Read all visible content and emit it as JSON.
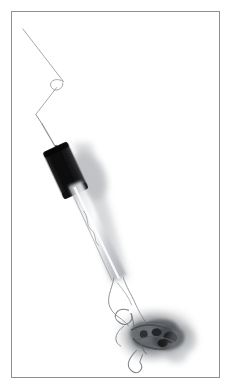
{
  "image": {
    "subject_label": "Tangled wire with black ferrule and knotted thread mass",
    "background_color": "#ffffff",
    "frame_color": "#8d8f93",
    "frame_inset_px": 11,
    "frame_border_px": 1,
    "orientation": "portrait",
    "width_px": 233,
    "height_px": 391
  },
  "elements": {
    "wire_label": "thin wire strand",
    "loop_label": "small wire loop",
    "kink_label": "wire kink bend",
    "ferrule_label": "black cylindrical ferrule",
    "ferrule_color": "#141414",
    "rod_label": "translucent gray rod shaft",
    "rod_color": "#b9bcc0",
    "shadow_label": "soft cast shadow",
    "shadow_color": "#9a9da2",
    "tangle_label": "tangled thread knot mass",
    "tangle_color": "#4e5154",
    "thread_label": "loose thread strands",
    "thread_color": "#8c9095"
  },
  "geometry": {
    "wire_path": "M 22,28 L 62,80",
    "loop_path": "M 62,80 C 54,75 47,80 51,85 C 55,90 64,85 62,80",
    "wire_path_2": "M 56,84 L 35,113",
    "wire_path_3": "M 35,113 L 57,152",
    "ferrule": {
      "x": 52,
      "y": 147,
      "w": 26,
      "h": 44,
      "rotate": -26
    },
    "rod_path": "M 72,186 L 116,278",
    "tangle_center": {
      "x": 150,
      "y": 336
    },
    "tangle_radius": 32
  }
}
